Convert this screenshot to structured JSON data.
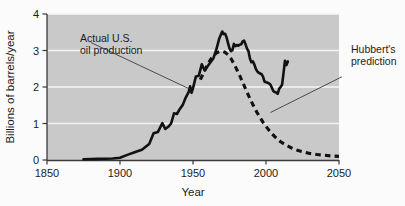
{
  "chart_data": {
    "type": "line",
    "title": "",
    "xlabel": "Year",
    "ylabel": "Billions of barrels/year",
    "xlim": [
      1850,
      2050
    ],
    "ylim": [
      0,
      4
    ],
    "xticks": [
      1850,
      1900,
      1950,
      2000,
      2050
    ],
    "xtick_labels": [
      "1850",
      "1900",
      "1950",
      "2000",
      "2050"
    ],
    "yticks": [
      0,
      1,
      2,
      3,
      4
    ],
    "ytick_labels": [
      "0",
      "1",
      "2",
      "3",
      "4"
    ],
    "grid": "horizontal-white-gridlines",
    "plot_background": "#c9c9c9",
    "legend_position": "none",
    "series": [
      {
        "name": "Actual U.S. oil production",
        "style": "solid",
        "color": "#111111",
        "points": [
          [
            1875,
            0.02
          ],
          [
            1885,
            0.03
          ],
          [
            1895,
            0.04
          ],
          [
            1900,
            0.06
          ],
          [
            1905,
            0.14
          ],
          [
            1910,
            0.21
          ],
          [
            1915,
            0.28
          ],
          [
            1920,
            0.44
          ],
          [
            1923,
            0.73
          ],
          [
            1926,
            0.77
          ],
          [
            1929,
            1.01
          ],
          [
            1931,
            0.85
          ],
          [
            1933,
            0.91
          ],
          [
            1935,
            1.0
          ],
          [
            1937,
            1.28
          ],
          [
            1939,
            1.26
          ],
          [
            1941,
            1.4
          ],
          [
            1943,
            1.51
          ],
          [
            1945,
            1.71
          ],
          [
            1947,
            1.86
          ],
          [
            1948,
            2.02
          ],
          [
            1949,
            1.84
          ],
          [
            1950,
            1.97
          ],
          [
            1952,
            2.29
          ],
          [
            1954,
            2.31
          ],
          [
            1956,
            2.62
          ],
          [
            1958,
            2.45
          ],
          [
            1960,
            2.57
          ],
          [
            1962,
            2.68
          ],
          [
            1964,
            2.79
          ],
          [
            1966,
            3.03
          ],
          [
            1968,
            3.33
          ],
          [
            1970,
            3.52
          ],
          [
            1971,
            3.45
          ],
          [
            1972,
            3.46
          ],
          [
            1973,
            3.36
          ],
          [
            1974,
            3.2
          ],
          [
            1975,
            3.06
          ],
          [
            1976,
            2.98
          ],
          [
            1977,
            3.01
          ],
          [
            1978,
            3.18
          ],
          [
            1979,
            3.12
          ],
          [
            1980,
            3.15
          ],
          [
            1981,
            3.13
          ],
          [
            1982,
            3.16
          ],
          [
            1983,
            3.17
          ],
          [
            1984,
            3.25
          ],
          [
            1985,
            3.27
          ],
          [
            1986,
            3.17
          ],
          [
            1987,
            3.05
          ],
          [
            1988,
            2.98
          ],
          [
            1989,
            2.78
          ],
          [
            1990,
            2.68
          ],
          [
            1991,
            2.7
          ],
          [
            1992,
            2.62
          ],
          [
            1993,
            2.5
          ],
          [
            1994,
            2.43
          ],
          [
            1995,
            2.39
          ],
          [
            1996,
            2.37
          ],
          [
            1997,
            2.35
          ],
          [
            1998,
            2.28
          ],
          [
            1999,
            2.15
          ],
          [
            2000,
            2.13
          ],
          [
            2001,
            2.12
          ],
          [
            2002,
            2.1
          ],
          [
            2003,
            2.07
          ],
          [
            2004,
            1.98
          ],
          [
            2005,
            1.89
          ],
          [
            2006,
            1.86
          ],
          [
            2007,
            1.85
          ],
          [
            2008,
            1.81
          ],
          [
            2009,
            1.95
          ],
          [
            2010,
            2.0
          ],
          [
            2011,
            2.06
          ],
          [
            2012,
            2.38
          ],
          [
            2013,
            2.72
          ],
          [
            2014,
            2.6
          ],
          [
            2015,
            2.7
          ]
        ]
      },
      {
        "name": "Hubbert's prediction",
        "style": "dashed",
        "color": "#111111",
        "points": [
          [
            1955,
            2.2
          ],
          [
            1958,
            2.45
          ],
          [
            1960,
            2.62
          ],
          [
            1962,
            2.75
          ],
          [
            1964,
            2.86
          ],
          [
            1966,
            2.93
          ],
          [
            1968,
            2.97
          ],
          [
            1970,
            2.98
          ],
          [
            1972,
            2.95
          ],
          [
            1974,
            2.88
          ],
          [
            1976,
            2.78
          ],
          [
            1978,
            2.64
          ],
          [
            1980,
            2.48
          ],
          [
            1982,
            2.31
          ],
          [
            1984,
            2.13
          ],
          [
            1986,
            1.95
          ],
          [
            1988,
            1.77
          ],
          [
            1990,
            1.6
          ],
          [
            1992,
            1.44
          ],
          [
            1994,
            1.29
          ],
          [
            1996,
            1.16
          ],
          [
            1998,
            1.03
          ],
          [
            2000,
            0.92
          ],
          [
            2003,
            0.77
          ],
          [
            2006,
            0.64
          ],
          [
            2010,
            0.5
          ],
          [
            2014,
            0.4
          ],
          [
            2018,
            0.32
          ],
          [
            2022,
            0.26
          ],
          [
            2026,
            0.22
          ],
          [
            2030,
            0.18
          ],
          [
            2035,
            0.15
          ],
          [
            2040,
            0.13
          ],
          [
            2045,
            0.11
          ],
          [
            2050,
            0.1
          ]
        ]
      }
    ],
    "annotations": [
      {
        "id": "actual-production",
        "lines": [
          "Actual U.S.",
          "oil production"
        ],
        "text": "Actual U.S. oil production",
        "leader_from": [
          1880,
          3.22
        ],
        "leader_to": [
          1948,
          1.94
        ]
      },
      {
        "id": "hubbert-prediction",
        "lines": [
          "Hubbert's",
          "prediction"
        ],
        "text": "Hubbert's prediction",
        "leader_from": [
          2052,
          2.28
        ],
        "leader_to": [
          2003,
          1.3
        ]
      }
    ]
  }
}
